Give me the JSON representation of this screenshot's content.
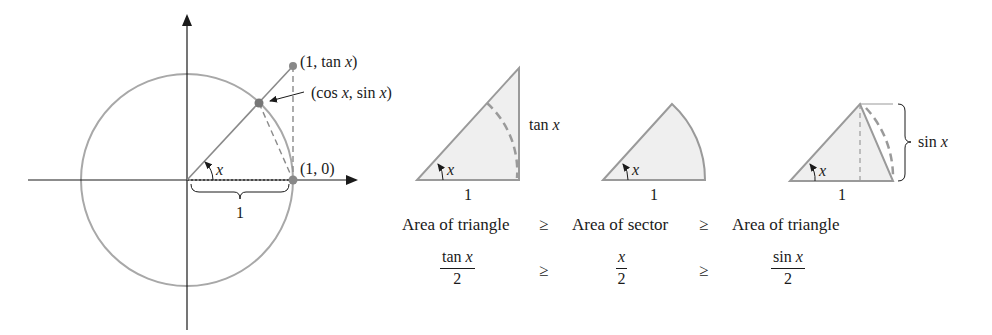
{
  "unit_circle": {
    "point_tan": "(1, tan x)",
    "point_cos_sin": "(cos x, sin x)",
    "point_one_zero": "(1, 0)",
    "angle_label": "x",
    "radius_label": "1"
  },
  "figures": {
    "outer_triangle": {
      "side_label": "tan x",
      "base_label": "1",
      "angle_label": "x"
    },
    "sector": {
      "base_label": "1",
      "angle_label": "x"
    },
    "inner_triangle": {
      "side_label": "sin x",
      "base_label": "1",
      "angle_label": "x"
    }
  },
  "comparison": {
    "row1": [
      "Area of triangle",
      "≥",
      "Area of sector",
      "≥",
      "Area of triangle"
    ],
    "row2": {
      "f1_num": "tan x",
      "f1_den": "2",
      "op1": "≥",
      "f2_num": "x",
      "f2_den": "2",
      "op2": "≥",
      "f3_num": "sin x",
      "f3_den": "2"
    }
  },
  "colors": {
    "gray_line": "#9a9a9a",
    "dark_point": "#777777",
    "fill": "#efefef",
    "ink": "#1a1a1a"
  }
}
